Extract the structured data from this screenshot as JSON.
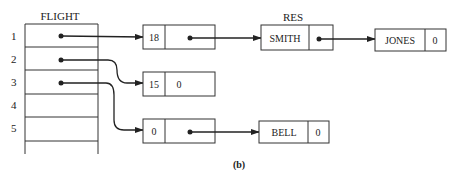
{
  "figure": {
    "caption": "(b)",
    "flight_table": {
      "title": "FLIGHT",
      "rows": [
        "1",
        "2",
        "3",
        "4",
        "5"
      ]
    },
    "flight_nodes": [
      {
        "id": "node-18",
        "value": "18",
        "next": "pointer"
      },
      {
        "id": "node-15",
        "value": "15",
        "next": "0"
      },
      {
        "id": "node-0",
        "value": "0",
        "next": "pointer"
      }
    ],
    "res_label": "RES",
    "res_nodes": [
      {
        "id": "res-smith",
        "name": "SMITH",
        "next": "pointer"
      },
      {
        "id": "res-jones",
        "name": "JONES",
        "next": "0"
      },
      {
        "id": "res-bell",
        "name": "BELL",
        "next": "0"
      }
    ]
  }
}
